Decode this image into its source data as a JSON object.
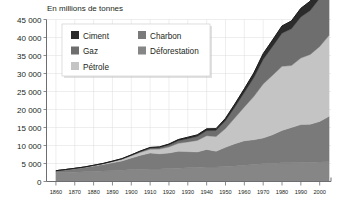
{
  "chart_data": {
    "type": "area",
    "title": "En millions de tonnes",
    "xlabel": "",
    "ylabel": "",
    "ylim": [
      0,
      45000
    ],
    "xlim": [
      1855,
      2006
    ],
    "grid": true,
    "legend_position": "top-left",
    "stacked": true,
    "y_ticks": [
      "0",
      "5 000",
      "10 000",
      "15 000",
      "20 000",
      "25 000",
      "30 000",
      "35 000",
      "40 000",
      "45 000"
    ],
    "y_tick_values": [
      0,
      5000,
      10000,
      15000,
      20000,
      25000,
      30000,
      35000,
      40000,
      45000
    ],
    "x_ticks": [
      "1860",
      "1870",
      "1880",
      "1890",
      "1900",
      "1910",
      "1920",
      "1930",
      "1940",
      "1950",
      "1960",
      "1970",
      "1980",
      "1990",
      "2000"
    ],
    "x_tick_values": [
      1860,
      1870,
      1880,
      1890,
      1900,
      1910,
      1920,
      1930,
      1940,
      1950,
      1960,
      1970,
      1980,
      1990,
      2000
    ],
    "x": [
      1860,
      1865,
      1870,
      1875,
      1880,
      1885,
      1890,
      1895,
      1900,
      1905,
      1910,
      1915,
      1920,
      1925,
      1930,
      1935,
      1940,
      1945,
      1950,
      1955,
      1960,
      1965,
      1970,
      1975,
      1980,
      1985,
      1990,
      1995,
      2000,
      2005
    ],
    "series": [
      {
        "name": "Déforestation",
        "color": "#868686",
        "values": [
          2400,
          2500,
          2600,
          2700,
          2800,
          2900,
          3000,
          3100,
          3300,
          3400,
          3500,
          3500,
          3600,
          3700,
          3800,
          3900,
          4000,
          4000,
          4200,
          4300,
          4500,
          4700,
          4900,
          5000,
          5200,
          5200,
          5300,
          5300,
          5400,
          5500
        ]
      },
      {
        "name": "Charbon",
        "color": "#7a7a7a",
        "values": [
          600,
          800,
          1000,
          1200,
          1500,
          1800,
          2200,
          2600,
          3200,
          3900,
          4400,
          4200,
          4300,
          4700,
          4500,
          4300,
          4900,
          4400,
          5300,
          6200,
          6800,
          6900,
          7200,
          8000,
          9000,
          9800,
          10500,
          10600,
          11300,
          12600
        ]
      },
      {
        "name": "Pétrole",
        "color": "#c4c4c4",
        "values": [
          0,
          20,
          50,
          90,
          150,
          220,
          320,
          450,
          620,
          820,
          1050,
          1300,
          1700,
          2200,
          2700,
          3200,
          3800,
          4100,
          5200,
          7200,
          9400,
          12000,
          15000,
          16500,
          17800,
          17200,
          18500,
          19400,
          20800,
          22500
        ]
      },
      {
        "name": "Gaz",
        "color": "#6e6e6e",
        "values": [
          0,
          0,
          10,
          20,
          40,
          60,
          90,
          130,
          180,
          250,
          330,
          420,
          550,
          720,
          900,
          1100,
          1400,
          1700,
          2200,
          3000,
          4000,
          5200,
          6800,
          8000,
          9200,
          10200,
          11400,
          12200,
          13400,
          15000
        ]
      },
      {
        "name": "Ciment",
        "color": "#2b2b2b",
        "values": [
          0,
          0,
          0,
          10,
          20,
          30,
          50,
          70,
          100,
          140,
          180,
          200,
          260,
          340,
          400,
          450,
          520,
          480,
          650,
          850,
          1050,
          1300,
          1600,
          1800,
          2000,
          2200,
          2400,
          2600,
          3000,
          3400
        ]
      }
    ],
    "legend": [
      {
        "label": "Ciment",
        "color": "#2b2b2b"
      },
      {
        "label": "Charbon",
        "color": "#7a7a7a"
      },
      {
        "label": "Gaz",
        "color": "#6e6e6e"
      },
      {
        "label": "Déforestation",
        "color": "#868686"
      },
      {
        "label": "Pétrole",
        "color": "#c4c4c4"
      }
    ]
  }
}
